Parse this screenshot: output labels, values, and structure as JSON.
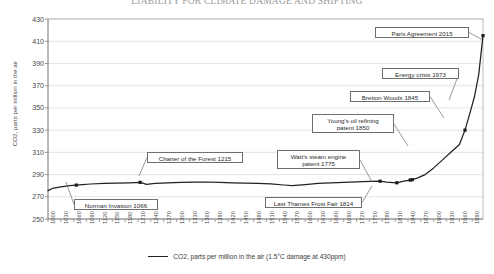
{
  "chart_data": {
    "type": "line",
    "title": "LIABILITY FOR CLIMATE DAMAGE AND SHIFTING",
    "xlabel": "",
    "ylabel": "CO2, parts per million in the air",
    "xlim": [
      1000,
      2015
    ],
    "ylim": [
      250,
      430
    ],
    "ytick_step": 20,
    "xtick_step": 30,
    "grid": true,
    "legend_position": "bottom",
    "legend": [
      "CO2, parts per million in the air (1.5°C damage at 430ppm)"
    ],
    "yticks": [
      250,
      270,
      290,
      310,
      330,
      350,
      370,
      390,
      410,
      430
    ],
    "xticks": [
      1000,
      1030,
      1060,
      1090,
      1120,
      1150,
      1180,
      1210,
      1240,
      1270,
      1300,
      1330,
      1360,
      1390,
      1420,
      1450,
      1480,
      1510,
      1540,
      1570,
      1600,
      1630,
      1660,
      1690,
      1720,
      1750,
      1780,
      1810,
      1840,
      1870,
      1900,
      1930,
      1960,
      1990
    ],
    "series": [
      {
        "name": "CO2, parts per million in the air (1.5°C damage at 430ppm)",
        "x": [
          1000,
          1010,
          1030,
          1050,
          1066,
          1080,
          1100,
          1130,
          1160,
          1190,
          1215,
          1230,
          1250,
          1280,
          1310,
          1340,
          1370,
          1400,
          1430,
          1460,
          1490,
          1520,
          1550,
          1570,
          1600,
          1630,
          1660,
          1690,
          1720,
          1750,
          1775,
          1790,
          1814,
          1830,
          1845,
          1860,
          1880,
          1900,
          1920,
          1940,
          1960,
          1973,
          1985,
          1995,
          2005,
          2015
        ],
        "y": [
          275.5,
          277.5,
          279.0,
          280.0,
          280.5,
          281.0,
          281.5,
          282.0,
          282.3,
          282.6,
          283.0,
          281.2,
          282.0,
          282.6,
          283.0,
          283.2,
          283.3,
          283.0,
          282.6,
          282.2,
          282.0,
          281.6,
          280.6,
          280.0,
          281.0,
          282.0,
          282.6,
          283.0,
          283.4,
          283.8,
          284.0,
          283.2,
          282.6,
          284.0,
          285.0,
          286.5,
          290.0,
          296.0,
          303.0,
          310.0,
          317.0,
          330.0,
          346.0,
          360.0,
          380.0,
          415.0
        ]
      }
    ],
    "markers": [
      {
        "x": 1066,
        "y": 280.5,
        "label": "Norman Invasion 1066"
      },
      {
        "x": 1215,
        "y": 283.0,
        "label": "Charter of the Forest 1215"
      },
      {
        "x": 1775,
        "y": 284.0,
        "label": "Watt's steam engine patent 1775"
      },
      {
        "x": 1814,
        "y": 282.6,
        "label": "Last Thames Frost Fair 1814"
      },
      {
        "x": 1845,
        "y": 285.0,
        "label": "Bretton Woods 1845"
      },
      {
        "x": 1850,
        "y": 285.4,
        "label": "Young's oil refining patent 1850"
      },
      {
        "x": 1973,
        "y": 330.0,
        "label": "Energy crisis 1973"
      },
      {
        "x": 2015,
        "y": 415.0,
        "label": "Paris Agreement 2015"
      }
    ],
    "annotations": [
      {
        "id": "paris",
        "text": "Paris Agreement 2015"
      },
      {
        "id": "energy",
        "text": "Energy crisis 1973"
      },
      {
        "id": "bretton",
        "text": "Bretton Woods 1845"
      },
      {
        "id": "young",
        "text": "Young's oil refining patent 1850"
      },
      {
        "id": "charter",
        "text": "Charter of the Forest 1215"
      },
      {
        "id": "watt",
        "text": "Watt's steam engine patent 1775"
      },
      {
        "id": "frost",
        "text": "Last Thames Frost Fair 1814"
      },
      {
        "id": "norman",
        "text": "Norman Invasion 1066"
      }
    ],
    "colors": {
      "line": "#222222",
      "grid": "#d9d9d9",
      "axis": "#aaaaaa",
      "text": "#3a3a3a",
      "callout_border": "#6f6f6f",
      "background": "#ffffff"
    }
  },
  "annotations_text": {
    "paris": "Paris Agreement 2015",
    "energy": "Energy crisis 1973",
    "bretton": "Bretton Woods 1845",
    "young_line1": "Young's oil refining",
    "young_line2": "patent 1850",
    "charter": "Charter of the Forest 1215",
    "watt_line1": "Watt's steam engine",
    "watt_line2": "patent 1775",
    "frost": "Last Thames Frost Fair 1814",
    "norman": "Norman Invasion 1066"
  },
  "title": "LIABILITY FOR CLIMATE DAMAGE AND SHIFTING",
  "axes": {
    "y_title": "CO2, parts per million in the air"
  },
  "legend": {
    "label": "CO2, parts per million in the air (1.5°C damage at 430ppm)"
  }
}
